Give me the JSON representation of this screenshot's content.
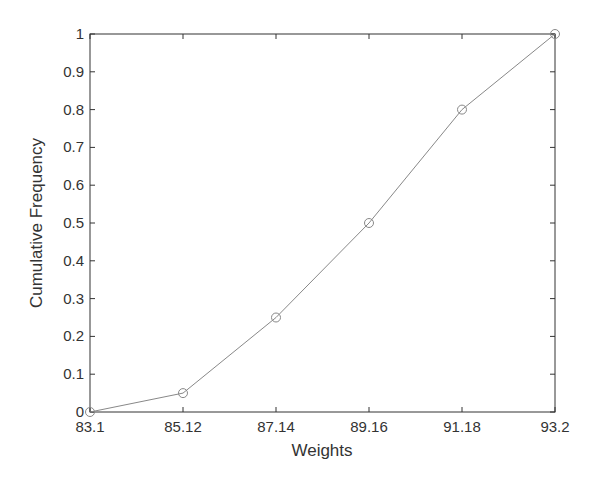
{
  "chart_data": {
    "type": "line",
    "title": "",
    "xlabel": "Weights",
    "ylabel": "Cumulative Frequency",
    "x": [
      83.1,
      85.12,
      87.14,
      89.16,
      91.18,
      93.2
    ],
    "series": [
      {
        "name": "Cumulative Frequency",
        "values": [
          0,
          0.05,
          0.25,
          0.5,
          0.8,
          1.0
        ],
        "marker": "circle",
        "color": "#888888"
      }
    ],
    "xlim": [
      83.1,
      93.2
    ],
    "ylim": [
      0,
      1
    ],
    "xticks": [
      "83.1",
      "85.12",
      "87.14",
      "89.16",
      "91.18",
      "93.2"
    ],
    "yticks": [
      "0",
      "0.1",
      "0.2",
      "0.3",
      "0.4",
      "0.5",
      "0.6",
      "0.7",
      "0.8",
      "0.9",
      "1"
    ],
    "grid": false,
    "legend": null
  }
}
